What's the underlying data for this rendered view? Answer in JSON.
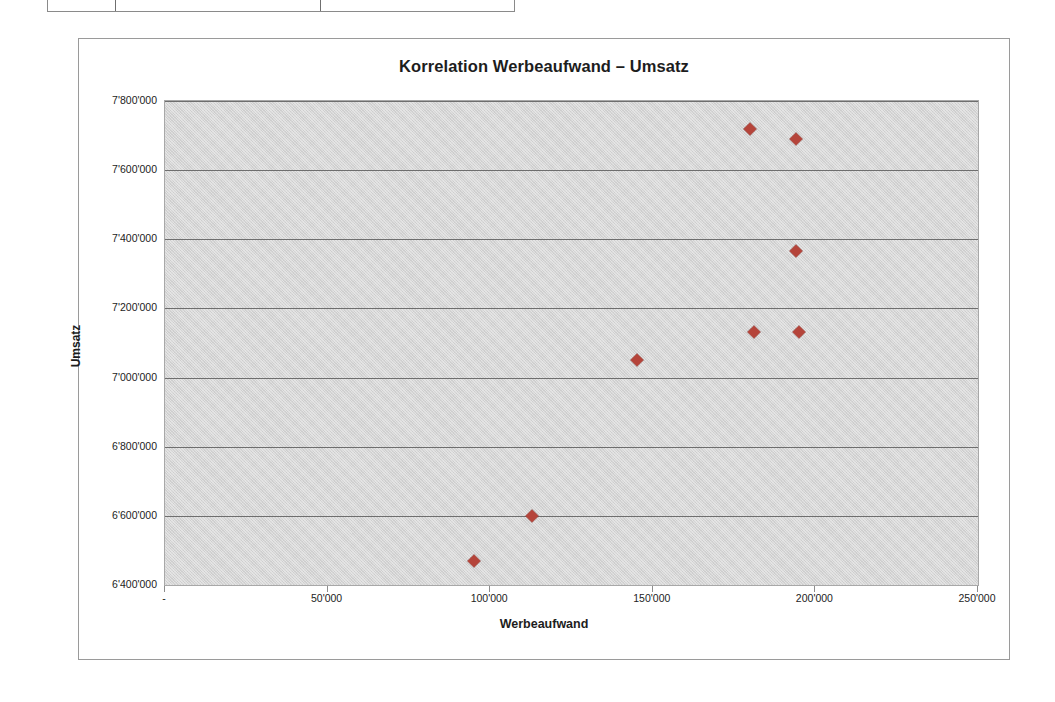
{
  "table_fragment": {
    "columns": [
      "",
      "",
      ""
    ]
  },
  "chart_data": {
    "type": "scatter",
    "title": "Korrelation Werbeaufwand – Umsatz",
    "xlabel": "Werbeaufwand",
    "ylabel": "Umsatz",
    "xlim": [
      0,
      250000
    ],
    "ylim": [
      6400000,
      7800000
    ],
    "grid": true,
    "legend": "none",
    "marker_color": "#b5443a",
    "marker_shape": "diamond",
    "plot_background": "#d5d5d5",
    "x_ticks": [
      "-",
      "50'000",
      "100'000",
      "150'000",
      "200'000",
      "250'000"
    ],
    "x_tick_values": [
      0,
      50000,
      100000,
      150000,
      200000,
      250000
    ],
    "y_ticks": [
      "6'400'000",
      "6'600'000",
      "6'800'000",
      "7'000'000",
      "7'200'000",
      "7'400'000",
      "7'600'000",
      "7'800'000"
    ],
    "y_tick_values": [
      6400000,
      6600000,
      6800000,
      7000000,
      7200000,
      7400000,
      7600000,
      7800000
    ],
    "points": [
      {
        "x": 95000,
        "y": 6470000
      },
      {
        "x": 113000,
        "y": 6600000
      },
      {
        "x": 145000,
        "y": 7050000
      },
      {
        "x": 180000,
        "y": 7718000
      },
      {
        "x": 181000,
        "y": 7133000
      },
      {
        "x": 194000,
        "y": 7690000
      },
      {
        "x": 194000,
        "y": 7367000
      },
      {
        "x": 195000,
        "y": 7133000
      }
    ]
  }
}
